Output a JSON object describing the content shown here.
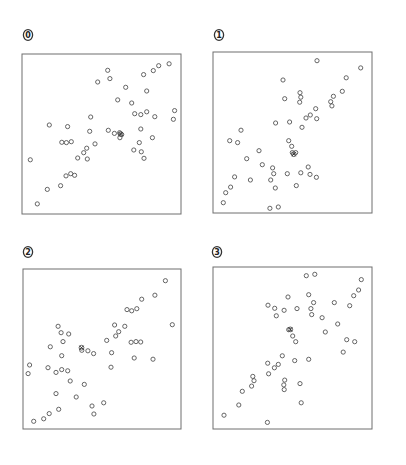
{
  "chart_data": [
    {
      "type": "scatter",
      "label": "0",
      "title": "",
      "xlabel": "",
      "ylabel": "",
      "xlim": [
        0,
        1
      ],
      "ylim": [
        0,
        1
      ],
      "grid": false,
      "legend": "none",
      "marker": "open-circle",
      "points": [
        [
          0.539,
          0.898
        ],
        [
          0.925,
          0.939
        ],
        [
          0.86,
          0.927
        ],
        [
          0.826,
          0.896
        ],
        [
          0.765,
          0.871
        ],
        [
          0.476,
          0.825
        ],
        [
          0.553,
          0.846
        ],
        [
          0.652,
          0.792
        ],
        [
          0.784,
          0.769
        ],
        [
          0.602,
          0.713
        ],
        [
          0.69,
          0.694
        ],
        [
          0.709,
          0.627
        ],
        [
          0.747,
          0.621
        ],
        [
          0.784,
          0.639
        ],
        [
          0.835,
          0.608
        ],
        [
          0.96,
          0.646
        ],
        [
          0.952,
          0.592
        ],
        [
          0.432,
          0.606
        ],
        [
          0.172,
          0.556
        ],
        [
          0.287,
          0.546
        ],
        [
          0.426,
          0.517
        ],
        [
          0.543,
          0.523
        ],
        [
          0.581,
          0.504
        ],
        [
          0.614,
          0.508
        ],
        [
          0.627,
          0.496
        ],
        [
          0.616,
          0.477
        ],
        [
          0.747,
          0.531
        ],
        [
          0.82,
          0.477
        ],
        [
          0.738,
          0.446
        ],
        [
          0.703,
          0.4
        ],
        [
          0.75,
          0.389
        ],
        [
          0.767,
          0.348
        ],
        [
          0.25,
          0.448
        ],
        [
          0.279,
          0.446
        ],
        [
          0.31,
          0.452
        ],
        [
          0.459,
          0.438
        ],
        [
          0.407,
          0.411
        ],
        [
          0.388,
          0.383
        ],
        [
          0.35,
          0.35
        ],
        [
          0.411,
          0.344
        ],
        [
          0.052,
          0.339
        ],
        [
          0.306,
          0.252
        ],
        [
          0.277,
          0.238
        ],
        [
          0.331,
          0.242
        ],
        [
          0.243,
          0.177
        ],
        [
          0.159,
          0.154
        ],
        [
          0.096,
          0.063
        ]
      ],
      "centroid": [
        0.62,
        0.5
      ]
    },
    {
      "type": "scatter",
      "label": "1",
      "title": "",
      "xlabel": "",
      "ylabel": "",
      "xlim": [
        0,
        1
      ],
      "ylim": [
        0,
        1
      ],
      "grid": false,
      "legend": "none",
      "marker": "open-circle",
      "points": [
        [
          0.654,
          0.946
        ],
        [
          0.929,
          0.901
        ],
        [
          0.838,
          0.84
        ],
        [
          0.44,
          0.826
        ],
        [
          0.547,
          0.747
        ],
        [
          0.552,
          0.719
        ],
        [
          0.545,
          0.688
        ],
        [
          0.451,
          0.71
        ],
        [
          0.813,
          0.756
        ],
        [
          0.757,
          0.725
        ],
        [
          0.74,
          0.691
        ],
        [
          0.748,
          0.665
        ],
        [
          0.646,
          0.648
        ],
        [
          0.612,
          0.609
        ],
        [
          0.585,
          0.59
        ],
        [
          0.652,
          0.586
        ],
        [
          0.394,
          0.559
        ],
        [
          0.482,
          0.565
        ],
        [
          0.56,
          0.532
        ],
        [
          0.176,
          0.514
        ],
        [
          0.105,
          0.449
        ],
        [
          0.155,
          0.437
        ],
        [
          0.476,
          0.449
        ],
        [
          0.495,
          0.414
        ],
        [
          0.499,
          0.375
        ],
        [
          0.52,
          0.375
        ],
        [
          0.289,
          0.387
        ],
        [
          0.212,
          0.337
        ],
        [
          0.31,
          0.3
        ],
        [
          0.375,
          0.28
        ],
        [
          0.599,
          0.286
        ],
        [
          0.382,
          0.244
        ],
        [
          0.467,
          0.244
        ],
        [
          0.552,
          0.25
        ],
        [
          0.61,
          0.24
        ],
        [
          0.65,
          0.222
        ],
        [
          0.136,
          0.224
        ],
        [
          0.235,
          0.205
        ],
        [
          0.363,
          0.205
        ],
        [
          0.111,
          0.161
        ],
        [
          0.392,
          0.155
        ],
        [
          0.524,
          0.17
        ],
        [
          0.08,
          0.126
        ],
        [
          0.065,
          0.064
        ],
        [
          0.358,
          0.029
        ],
        [
          0.411,
          0.037
        ]
      ],
      "centroid": [
        0.508,
        0.365
      ]
    },
    {
      "type": "scatter",
      "label": "2",
      "title": "",
      "xlabel": "",
      "ylabel": "",
      "xlim": [
        0,
        1
      ],
      "ylim": [
        0,
        1
      ],
      "grid": false,
      "legend": "none",
      "marker": "open-circle",
      "points": [
        [
          0.901,
          0.927
        ],
        [
          0.835,
          0.836
        ],
        [
          0.751,
          0.811
        ],
        [
          0.658,
          0.746
        ],
        [
          0.688,
          0.739
        ],
        [
          0.72,
          0.752
        ],
        [
          0.945,
          0.652
        ],
        [
          0.58,
          0.65
        ],
        [
          0.644,
          0.642
        ],
        [
          0.606,
          0.608
        ],
        [
          0.587,
          0.581
        ],
        [
          0.53,
          0.554
        ],
        [
          0.684,
          0.542
        ],
        [
          0.715,
          0.546
        ],
        [
          0.745,
          0.544
        ],
        [
          0.222,
          0.642
        ],
        [
          0.241,
          0.602
        ],
        [
          0.289,
          0.594
        ],
        [
          0.253,
          0.546
        ],
        [
          0.173,
          0.514
        ],
        [
          0.372,
          0.492
        ],
        [
          0.411,
          0.489
        ],
        [
          0.447,
          0.471
        ],
        [
          0.561,
          0.477
        ],
        [
          0.245,
          0.458
        ],
        [
          0.704,
          0.444
        ],
        [
          0.823,
          0.436
        ],
        [
          0.042,
          0.4
        ],
        [
          0.032,
          0.346
        ],
        [
          0.158,
          0.383
        ],
        [
          0.209,
          0.354
        ],
        [
          0.245,
          0.371
        ],
        [
          0.283,
          0.364
        ],
        [
          0.557,
          0.386
        ],
        [
          0.299,
          0.3
        ],
        [
          0.388,
          0.279
        ],
        [
          0.209,
          0.221
        ],
        [
          0.337,
          0.2
        ],
        [
          0.437,
          0.144
        ],
        [
          0.511,
          0.164
        ],
        [
          0.449,
          0.094
        ],
        [
          0.226,
          0.123
        ],
        [
          0.166,
          0.096
        ],
        [
          0.131,
          0.064
        ],
        [
          0.068,
          0.048
        ]
      ],
      "centroid": [
        0.37,
        0.508
      ]
    },
    {
      "type": "scatter",
      "label": "3",
      "title": "",
      "xlabel": "",
      "ylabel": "",
      "xlim": [
        0,
        1
      ],
      "ylim": [
        0,
        1
      ],
      "grid": false,
      "legend": "none",
      "marker": "open-circle",
      "points": [
        [
          0.587,
          0.946
        ],
        [
          0.64,
          0.955
        ],
        [
          0.933,
          0.922
        ],
        [
          0.916,
          0.858
        ],
        [
          0.885,
          0.823
        ],
        [
          0.86,
          0.761
        ],
        [
          0.763,
          0.78
        ],
        [
          0.472,
          0.815
        ],
        [
          0.602,
          0.829
        ],
        [
          0.633,
          0.78
        ],
        [
          0.616,
          0.743
        ],
        [
          0.621,
          0.706
        ],
        [
          0.686,
          0.687
        ],
        [
          0.346,
          0.764
        ],
        [
          0.388,
          0.745
        ],
        [
          0.447,
          0.733
        ],
        [
          0.528,
          0.743
        ],
        [
          0.398,
          0.699
        ],
        [
          0.784,
          0.648
        ],
        [
          0.706,
          0.599
        ],
        [
          0.476,
          0.613
        ],
        [
          0.501,
          0.574
        ],
        [
          0.52,
          0.539
        ],
        [
          0.841,
          0.551
        ],
        [
          0.891,
          0.539
        ],
        [
          0.819,
          0.475
        ],
        [
          0.436,
          0.452
        ],
        [
          0.514,
          0.422
        ],
        [
          0.602,
          0.43
        ],
        [
          0.344,
          0.406
        ],
        [
          0.411,
          0.399
        ],
        [
          0.386,
          0.378
        ],
        [
          0.35,
          0.341
        ],
        [
          0.25,
          0.325
        ],
        [
          0.258,
          0.298
        ],
        [
          0.243,
          0.265
        ],
        [
          0.451,
          0.302
        ],
        [
          0.445,
          0.272
        ],
        [
          0.448,
          0.243
        ],
        [
          0.547,
          0.28
        ],
        [
          0.184,
          0.233
        ],
        [
          0.555,
          0.162
        ],
        [
          0.162,
          0.148
        ],
        [
          0.069,
          0.085
        ],
        [
          0.342,
          0.041
        ]
      ],
      "centroid": [
        0.486,
        0.615
      ]
    }
  ]
}
